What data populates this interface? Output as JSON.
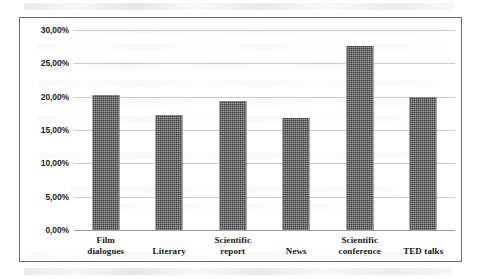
{
  "chart_data": {
    "type": "bar",
    "title": "",
    "xlabel": "",
    "ylabel": "",
    "categories": [
      "Film dialogues",
      "Literary",
      "Scientific report",
      "News",
      "Scientific conference",
      "TED talks"
    ],
    "values": [
      20.3,
      17.3,
      19.4,
      16.8,
      27.6,
      20.0
    ],
    "value_labels": [
      "20,30%",
      "17,30%",
      "19,40%",
      "16,80%",
      "27,60%",
      "20,00%"
    ],
    "ylim": [
      0,
      30
    ],
    "ytick_values": [
      0,
      5,
      10,
      15,
      20,
      25,
      30
    ],
    "ytick_labels": [
      "0,00%",
      "5,00%",
      "10,00%",
      "15,00%",
      "20,00%",
      "25,00%",
      "30,00%"
    ],
    "grid": true,
    "legend": null,
    "legend_position": "none",
    "bar_color": "#3b3b3b",
    "bar_pattern": "fine-checker-dither",
    "gridline_color": "#c9c9c9",
    "border_color": "#6b6b6b",
    "background_color": "#ffffff",
    "decimal_separator": ","
  },
  "category_lines": [
    [
      "Film",
      "dialogues"
    ],
    [
      "Literary",
      ""
    ],
    [
      "Scientific",
      "report"
    ],
    [
      "News",
      ""
    ],
    [
      "Scientific",
      "conference"
    ],
    [
      "TED talks",
      ""
    ]
  ]
}
